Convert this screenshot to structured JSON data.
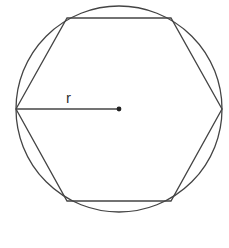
{
  "diagram": {
    "type": "geometry",
    "labels": {
      "radius": "r"
    },
    "colors": {
      "stroke": "#444444",
      "background": "#ffffff"
    },
    "shapes": {
      "circle": {
        "cx": 119,
        "cy": 109,
        "r": 103
      },
      "hexagon": {
        "vertices": [
          [
            16,
            109
          ],
          [
            67,
            18
          ],
          [
            171,
            18
          ],
          [
            222,
            109
          ],
          [
            171,
            201
          ],
          [
            67,
            201
          ]
        ]
      },
      "center_point": {
        "cx": 119,
        "cy": 109
      },
      "radius_line": {
        "x1": 16,
        "y1": 109,
        "x2": 119,
        "y2": 109
      }
    }
  }
}
